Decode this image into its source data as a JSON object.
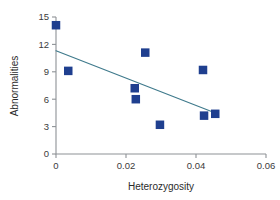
{
  "chart_data": {
    "type": "scatter",
    "title": "",
    "xlabel": "Heterozygosity",
    "ylabel": "Abnormalities",
    "xlim": [
      0,
      0.06
    ],
    "ylim": [
      0,
      15
    ],
    "xticks": [
      "0",
      "0.02",
      "0.04",
      "0.06"
    ],
    "xtick_values": [
      0,
      0.02,
      0.04,
      0.06
    ],
    "yticks": [
      "0",
      "3",
      "6",
      "9",
      "12",
      "15"
    ],
    "ytick_values": [
      0,
      3,
      6,
      9,
      12,
      15
    ],
    "grid": false,
    "legend": "none",
    "marker_shape": "square",
    "marker_color": "#1f3f8f",
    "line_color": "#3f7a8c",
    "axis_color": "#8e9296",
    "points": [
      {
        "x": 0.0,
        "y": 14.1
      },
      {
        "x": 0.0035,
        "y": 9.1
      },
      {
        "x": 0.0225,
        "y": 7.2
      },
      {
        "x": 0.0228,
        "y": 6.0
      },
      {
        "x": 0.0255,
        "y": 11.1
      },
      {
        "x": 0.0297,
        "y": 3.2
      },
      {
        "x": 0.042,
        "y": 9.2
      },
      {
        "x": 0.0423,
        "y": 4.2
      },
      {
        "x": 0.0455,
        "y": 4.4
      }
    ],
    "trendline": {
      "name": "regression-line",
      "x0": 0.0,
      "y0": 11.3,
      "x1": 0.0448,
      "y1": 4.6
    }
  }
}
